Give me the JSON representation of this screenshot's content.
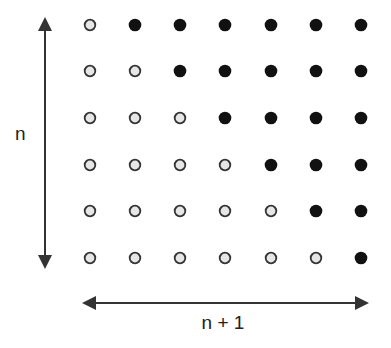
{
  "diagram": {
    "vertical_label": "n",
    "horizontal_label": "n + 1",
    "rows": 6,
    "columns": 7,
    "colors": {
      "filled": "#111111",
      "hollow_fill": "#e6e6e6",
      "hollow_stroke": "#333333",
      "arrow": "#333333"
    },
    "grid": [
      [
        "hollow",
        "filled",
        "filled",
        "filled",
        "filled",
        "filled",
        "filled"
      ],
      [
        "hollow",
        "hollow",
        "filled",
        "filled",
        "filled",
        "filled",
        "filled"
      ],
      [
        "hollow",
        "hollow",
        "hollow",
        "filled",
        "filled",
        "filled",
        "filled"
      ],
      [
        "hollow",
        "hollow",
        "hollow",
        "hollow",
        "filled",
        "filled",
        "filled"
      ],
      [
        "hollow",
        "hollow",
        "hollow",
        "hollow",
        "hollow",
        "filled",
        "filled"
      ],
      [
        "hollow",
        "hollow",
        "hollow",
        "hollow",
        "hollow",
        "hollow",
        "filled"
      ]
    ]
  }
}
